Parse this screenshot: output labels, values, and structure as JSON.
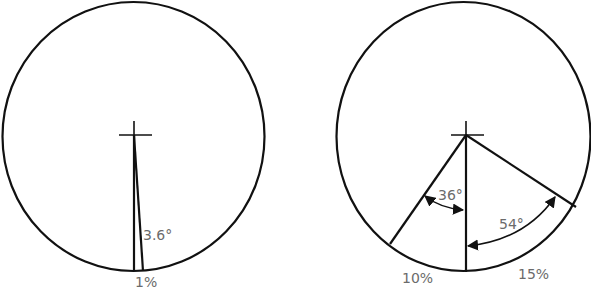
{
  "diagrams": [
    {
      "name": "left-circle",
      "angle_label": "3.6°",
      "percent_label": "1%"
    },
    {
      "name": "right-circle",
      "angle_labels": [
        "36°",
        "54°"
      ],
      "percent_labels": [
        "10%",
        "15%"
      ]
    }
  ],
  "colors": {
    "line": "#111111",
    "label": "#6b6b6b",
    "background": "#ffffff"
  }
}
